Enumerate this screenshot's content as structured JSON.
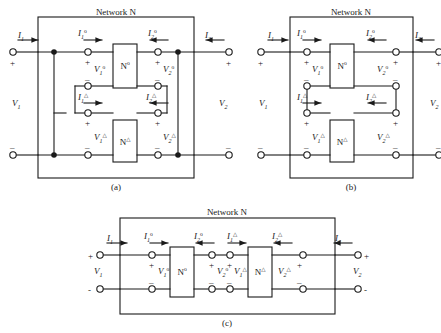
{
  "figure": {
    "title_absent": true,
    "background_color": "#ffffff",
    "line_color": "#1a1a1a",
    "panels": [
      {
        "id": "a",
        "caption": "(a)",
        "network_label": "Network N",
        "connection_type": "parallel-parallel",
        "blocks": [
          {
            "name": "N",
            "superscript": "o"
          },
          {
            "name": "N",
            "superscript": "△"
          }
        ],
        "external_ports": {
          "input_current": "I",
          "input_current_sub": "1",
          "input_voltage": "V",
          "input_voltage_sub": "1",
          "output_current": "I",
          "output_current_sub": "2",
          "output_voltage": "V",
          "output_voltage_sub": "2",
          "plus": "+",
          "minus": "–"
        },
        "internal_labels": [
          {
            "sym": "I",
            "sub": "1",
            "sup": "o"
          },
          {
            "sym": "I",
            "sub": "2",
            "sup": "o"
          },
          {
            "sym": "V",
            "sub": "1",
            "sup": "o"
          },
          {
            "sym": "V",
            "sub": "2",
            "sup": "o"
          },
          {
            "sym": "I",
            "sub": "1",
            "sup": "△"
          },
          {
            "sym": "I",
            "sub": "2",
            "sup": "△"
          },
          {
            "sym": "V",
            "sub": "1",
            "sup": "△"
          },
          {
            "sym": "V",
            "sub": "2",
            "sup": "△"
          }
        ]
      },
      {
        "id": "b",
        "caption": "(b)",
        "network_label": "Network N",
        "connection_type": "series-series",
        "blocks": [
          {
            "name": "N",
            "superscript": "o"
          },
          {
            "name": "N",
            "superscript": "△"
          }
        ],
        "external_ports": {
          "input_current": "I",
          "input_current_sub": "1",
          "input_voltage": "V",
          "input_voltage_sub": "1",
          "output_current": "I",
          "output_current_sub": "2",
          "output_voltage": "V",
          "output_voltage_sub": "2",
          "plus": "+",
          "minus": "–"
        },
        "internal_labels": [
          {
            "sym": "I",
            "sub": "1",
            "sup": "o"
          },
          {
            "sym": "I",
            "sub": "2",
            "sup": "o"
          },
          {
            "sym": "V",
            "sub": "1",
            "sup": "o"
          },
          {
            "sym": "V",
            "sub": "2",
            "sup": "o"
          },
          {
            "sym": "I",
            "sub": "1",
            "sup": "△"
          },
          {
            "sym": "I",
            "sub": "2",
            "sup": "△"
          },
          {
            "sym": "V",
            "sub": "1",
            "sup": "△"
          },
          {
            "sym": "V",
            "sub": "2",
            "sup": "△"
          }
        ]
      },
      {
        "id": "c",
        "caption": "(c)",
        "network_label": "Network N",
        "connection_type": "cascade",
        "blocks": [
          {
            "name": "N",
            "superscript": "o"
          },
          {
            "name": "N",
            "superscript": "△"
          }
        ],
        "external_ports": {
          "input_current": "I",
          "input_current_sub": "1",
          "input_voltage": "V",
          "input_voltage_sub": "1",
          "output_current": "I",
          "output_current_sub": "2",
          "output_voltage": "V",
          "output_voltage_sub": "2",
          "plus": "+",
          "minus": "-"
        },
        "internal_labels": [
          {
            "sym": "I",
            "sub": "1",
            "sup": "o"
          },
          {
            "sym": "I",
            "sub": "2",
            "sup": "o"
          },
          {
            "sym": "V",
            "sub": "1",
            "sup": "o"
          },
          {
            "sym": "V",
            "sub": "2",
            "sup": "o"
          },
          {
            "sym": "I",
            "sub": "1",
            "sup": "△"
          },
          {
            "sym": "I",
            "sub": "2",
            "sup": "△"
          },
          {
            "sym": "V",
            "sub": "1",
            "sup": "△"
          },
          {
            "sym": "V",
            "sub": "2",
            "sup": "△"
          }
        ]
      }
    ]
  },
  "text": {
    "network_n": "Network N",
    "cap_a": "(a)",
    "cap_b": "(b)",
    "cap_c": "(c)",
    "I": "I",
    "V": "V",
    "N": "N",
    "one": "1",
    "two": "2",
    "sup_o": "o",
    "sup_tri": "△",
    "plus": "+",
    "minus": "–",
    "minus_plain": "-"
  }
}
